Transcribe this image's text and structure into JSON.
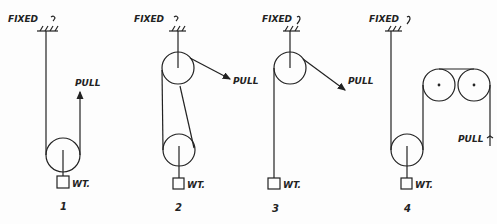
{
  "figure": {
    "ink_color": "#222222",
    "labels": {
      "fixed": "FIXED",
      "pull": "PULL",
      "weight": "WT."
    },
    "diagrams": [
      {
        "number": "1",
        "fixed": "FIXED",
        "pull": "PULL",
        "weight": "WT."
      },
      {
        "number": "2",
        "fixed": "FIXED",
        "pull": "PULL",
        "weight": "WT."
      },
      {
        "number": "3",
        "fixed": "FIXED",
        "pull": "PULL",
        "weight": "WT."
      },
      {
        "number": "4",
        "fixed": "FIXED",
        "pull": "PULL",
        "weight": "WT."
      }
    ]
  }
}
